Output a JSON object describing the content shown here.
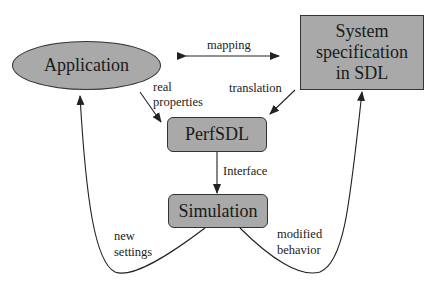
{
  "diagram": {
    "nodes": {
      "application": "Application",
      "system_spec_line1": "System",
      "system_spec_line2": "specification",
      "system_spec_line3": "in SDL",
      "perfsdl": "PerfSDL",
      "simulation": "Simulation"
    },
    "edges": {
      "mapping": "mapping",
      "real_properties_line1": "real",
      "real_properties_line2": "properties",
      "translation": "translation",
      "interface": "Interface",
      "new_settings_line1": "new",
      "new_settings_line2": "settings",
      "modified_behavior_line1": "modified",
      "modified_behavior_line2": "behavior"
    },
    "colors": {
      "node_fill": "#a9a9a9",
      "stroke": "#333333"
    }
  }
}
